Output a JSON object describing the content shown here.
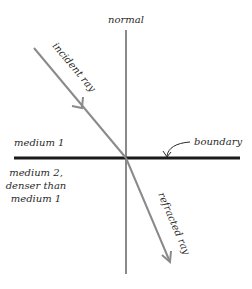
{
  "diagram": {
    "labels": {
      "normal": "normal",
      "incident_ray": "incident ray",
      "refracted_ray": "refracted ray",
      "boundary": "boundary",
      "medium1": "medium 1",
      "medium2_line1": "medium 2,",
      "medium2_line2": "denser than",
      "medium2_line3": "medium 1"
    },
    "colors": {
      "ray": "#8a8a8a",
      "normal": "#8a8a8a",
      "boundary": "#1a1a1a",
      "text": "#2a2a2a"
    }
  }
}
